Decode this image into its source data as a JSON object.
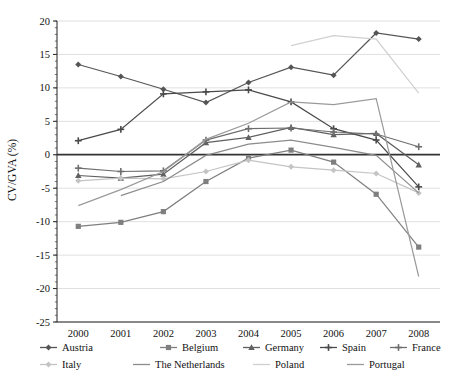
{
  "chart_data": {
    "type": "line",
    "title": "",
    "xlabel": "",
    "ylabel": "CV/GVA (%)",
    "categories": [
      "2000",
      "2001",
      "2002",
      "2003",
      "2004",
      "2005",
      "2006",
      "2007",
      "2008"
    ],
    "ylim": [
      -25,
      20
    ],
    "ytick_step": 5,
    "yticks": [
      "20",
      "15",
      "10",
      "5",
      "0",
      "-5",
      "-10",
      "-15",
      "-20",
      "-25"
    ],
    "grid": "horizontal",
    "legend_position": "bottom",
    "zero_line": true,
    "series": [
      {
        "name": "Austria",
        "color": "#555555",
        "marker": "diamond",
        "values": [
          13.5,
          11.7,
          9.8,
          7.8,
          10.8,
          13.1,
          11.9,
          18.2,
          17.3
        ]
      },
      {
        "name": "Belgium",
        "color": "#7f7f7f",
        "marker": "square",
        "values": [
          -10.7,
          -10.1,
          -8.5,
          -4.0,
          -0.5,
          0.7,
          -1.1,
          -5.9,
          -13.8
        ]
      },
      {
        "name": "Germany",
        "color": "#606060",
        "marker": "triangle",
        "values": [
          -3.1,
          -3.5,
          -2.9,
          1.8,
          2.6,
          4.1,
          3.0,
          3.2,
          -1.5
        ]
      },
      {
        "name": "Spain",
        "color": "#4a4a4a",
        "marker": "cross",
        "values": [
          2.1,
          3.8,
          9.1,
          9.4,
          9.7,
          7.9,
          3.9,
          2.2,
          -4.8
        ]
      },
      {
        "name": "France",
        "color": "#6e6e6e",
        "marker": "cross",
        "values": [
          -2.0,
          -2.5,
          -2.4,
          2.2,
          3.9,
          4.0,
          3.4,
          3.1,
          1.2
        ]
      },
      {
        "name": "Italy",
        "color": "#c4c4c4",
        "marker": "diamond",
        "values": [
          -3.9,
          -3.5,
          -3.6,
          -2.5,
          -0.8,
          -1.8,
          -2.3,
          -2.8,
          -5.7
        ]
      },
      {
        "name": "The Netherlands",
        "color": "#8c8c8c",
        "marker": "none",
        "values": [
          null,
          -6.1,
          -4.0,
          -0.1,
          1.6,
          2.2,
          1.1,
          -0.1,
          -5.7
        ]
      },
      {
        "name": "Poland",
        "color": "#d0d0d0",
        "marker": "none",
        "values": [
          null,
          null,
          null,
          null,
          null,
          16.3,
          17.8,
          17.3,
          9.2
        ]
      },
      {
        "name": "Portugal",
        "color": "#9a9a9a",
        "marker": "none",
        "values": [
          -7.6,
          -5.2,
          -2.5,
          2.3,
          4.7,
          7.9,
          7.5,
          8.4,
          -18.2
        ]
      }
    ]
  },
  "legend": {
    "row1": [
      "Austria",
      "Belgium",
      "Germany",
      "Spain",
      "France"
    ],
    "row2": [
      "Italy",
      "The Netherlands",
      "Poland",
      "Portugal"
    ]
  }
}
